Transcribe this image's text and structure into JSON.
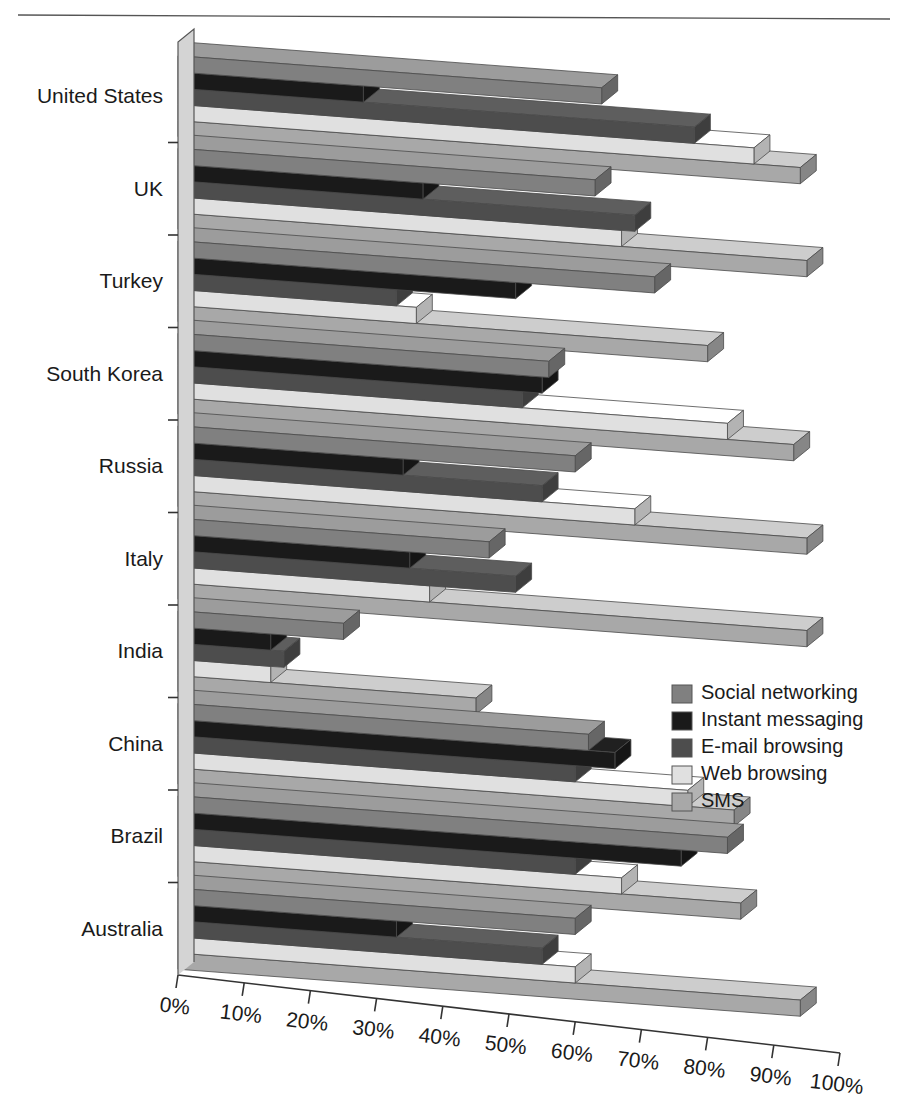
{
  "figure": {
    "has_top_rule": true,
    "background": "#ffffff"
  },
  "legend": {
    "position": "middle-right",
    "items": [
      {
        "label": "Social networking",
        "color": "#808080"
      },
      {
        "label": "Instant messaging",
        "color": "#1a1a1a"
      },
      {
        "label": "E-mail browsing",
        "color": "#4d4d4d"
      },
      {
        "label": "Web browsing",
        "color": "#e0e0e0"
      },
      {
        "label": "SMS",
        "color": "#a8a8a8"
      }
    ]
  },
  "axis": {
    "x_ticks": [
      "0%",
      "10%",
      "20%",
      "30%",
      "40%",
      "50%",
      "60%",
      "70%",
      "80%",
      "90%",
      "100%"
    ],
    "x_min": 0,
    "x_max": 100,
    "y_categories": [
      "United States",
      "UK",
      "Turkey",
      "South Korea",
      "Russia",
      "Italy",
      "India",
      "China",
      "Brazil",
      "Australia"
    ]
  },
  "chart_data": {
    "type": "bar",
    "orientation": "horizontal",
    "style": "3d-perspective-grouped",
    "title": "",
    "xlabel": "",
    "ylabel": "",
    "xlim": [
      0,
      100
    ],
    "grid": false,
    "legend_position": "middle-right",
    "categories": [
      "United States",
      "UK",
      "Turkey",
      "South Korea",
      "Russia",
      "Italy",
      "India",
      "China",
      "Brazil",
      "Australia"
    ],
    "series": [
      {
        "name": "Social networking",
        "color": "#808080",
        "values": [
          64,
          63,
          72,
          56,
          60,
          47,
          25,
          62,
          83,
          60
        ]
      },
      {
        "name": "Instant messaging",
        "color": "#1a1a1a",
        "values": [
          28,
          37,
          51,
          55,
          34,
          35,
          14,
          66,
          76,
          33
        ]
      },
      {
        "name": "E-mail browsing",
        "color": "#4d4d4d",
        "values": [
          78,
          69,
          33,
          52,
          55,
          51,
          16,
          60,
          60,
          55
        ]
      },
      {
        "name": "Web browsing",
        "color": "#e0e0e0",
        "values": [
          87,
          67,
          36,
          83,
          69,
          38,
          14,
          77,
          67,
          60
        ]
      },
      {
        "name": "SMS",
        "color": "#a8a8a8",
        "values": [
          94,
          95,
          80,
          93,
          95,
          95,
          45,
          84,
          85,
          94
        ]
      }
    ]
  }
}
